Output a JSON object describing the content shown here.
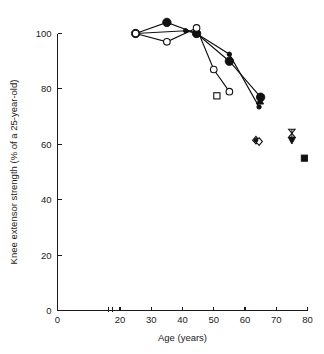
{
  "figure": {
    "background_color": "#ffffff",
    "ink_color": "#111111"
  },
  "chart_data": {
    "type": "scatter",
    "title": "",
    "subtitle": "",
    "xlabel": "Age (years)",
    "ylabel": "Knee extensor strength (% of a 25-year-old)",
    "xlim": [
      0,
      80
    ],
    "ylim": [
      0,
      105
    ],
    "x_ticks": [
      0,
      20,
      30,
      40,
      50,
      60,
      70,
      80
    ],
    "x_tick_labels": [
      "0",
      "20",
      "30",
      "40",
      "50",
      "60",
      "70",
      "80"
    ],
    "y_ticks": [
      0,
      20,
      40,
      60,
      80,
      100
    ],
    "y_tick_labels": [
      "0",
      "20",
      "40",
      "60",
      "80",
      "100"
    ],
    "x_axis_break": {
      "present": true,
      "position": 17,
      "label": "axis-break"
    },
    "grid": false,
    "legend": {
      "present": false,
      "position": "none"
    },
    "series": [
      {
        "name": "Series A (large filled circle)",
        "marker": "filled-circle-large",
        "connected": true,
        "points": [
          {
            "x": 25,
            "y": 100
          },
          {
            "x": 35,
            "y": 104
          },
          {
            "x": 44.5,
            "y": 100
          },
          {
            "x": 55,
            "y": 90
          },
          {
            "x": 65,
            "y": 77
          }
        ]
      },
      {
        "name": "Series B (small filled circle)",
        "marker": "filled-circle-small",
        "connected": true,
        "points": [
          {
            "x": 25,
            "y": 100
          },
          {
            "x": 41,
            "y": 101
          },
          {
            "x": 44.5,
            "y": 100
          },
          {
            "x": 55,
            "y": 92.5
          },
          {
            "x": 64.5,
            "y": 73.5
          }
        ]
      },
      {
        "name": "Series C (open circle)",
        "marker": "open-circle",
        "connected": true,
        "points": [
          {
            "x": 25,
            "y": 100
          },
          {
            "x": 35,
            "y": 97
          },
          {
            "x": 44.5,
            "y": 102
          },
          {
            "x": 50,
            "y": 87
          },
          {
            "x": 55,
            "y": 79
          }
        ]
      },
      {
        "name": "Series D (filled triangle-up)",
        "marker": "filled-triangle-up",
        "connected": false,
        "points": [
          {
            "x": 64.8,
            "y": 75.5
          }
        ]
      },
      {
        "name": "Series E (open square)",
        "marker": "open-square",
        "connected": false,
        "points": [
          {
            "x": 51,
            "y": 77.5
          }
        ]
      },
      {
        "name": "Series F (diamond cluster)",
        "marker": "open-diamond",
        "connected": false,
        "points": [
          {
            "x": 63.5,
            "y": 61.5
          },
          {
            "x": 64.5,
            "y": 61
          }
        ]
      },
      {
        "name": "Series G (bowtie / hourglass)",
        "marker": "bowtie",
        "connected": false,
        "points": [
          {
            "x": 75,
            "y": 64
          }
        ]
      },
      {
        "name": "Series H (filled triangle-down)",
        "marker": "filled-triangle-down",
        "connected": false,
        "points": [
          {
            "x": 75,
            "y": 61.5
          }
        ]
      },
      {
        "name": "Series I (filled square)",
        "marker": "filled-square",
        "connected": false,
        "points": [
          {
            "x": 79,
            "y": 55
          }
        ]
      }
    ]
  }
}
